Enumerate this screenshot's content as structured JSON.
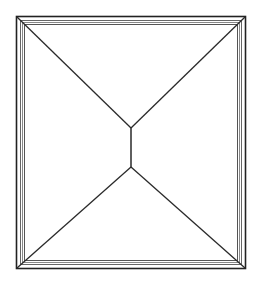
{
  "diagram": {
    "type": "hip-roof-plan",
    "width": 254,
    "height": 281,
    "colors": {
      "background": "#ffffff",
      "line": "#2a2a2a",
      "frame_outer": "#222222",
      "frame_inner": "#555555"
    },
    "outer_frame": {
      "x": 16,
      "y": 16,
      "w": 230,
      "h": 253
    },
    "inner_bands": [
      {
        "x": 20,
        "y": 20,
        "w": 222,
        "h": 245
      },
      {
        "x": 22,
        "y": 22,
        "w": 218,
        "h": 241
      },
      {
        "x": 24,
        "y": 24,
        "w": 214,
        "h": 237
      }
    ],
    "ridge": {
      "x1": 131,
      "y1": 128,
      "x2": 131,
      "y2": 167
    },
    "hips": [
      {
        "from": [
          17,
          17
        ],
        "to": [
          131,
          128
        ]
      },
      {
        "from": [
          245,
          17
        ],
        "to": [
          131,
          128
        ]
      },
      {
        "from": [
          17,
          268
        ],
        "to": [
          131,
          167
        ]
      },
      {
        "from": [
          245,
          268
        ],
        "to": [
          131,
          167
        ]
      }
    ]
  }
}
